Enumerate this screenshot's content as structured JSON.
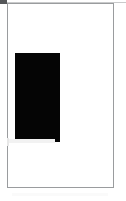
{
  "canvas": {
    "width_px": 126,
    "height_px": 201,
    "background_color": "#ffffff"
  },
  "document_view": {
    "name": "blank-page-with-black-block",
    "page": {
      "left_px": 7,
      "top_px": 3,
      "width_px": 107,
      "height_px": 185,
      "fill_color": "#ffffff",
      "border_color": "#9a9c9e",
      "border_width_px": 1
    },
    "text_content": "",
    "blocks": [
      {
        "id": "black-block",
        "shape": "rectangle",
        "fill_color": "#050505",
        "left_px": 7,
        "top_px": 49,
        "width_px": 45,
        "height_px": 89
      }
    ]
  },
  "chrome": {
    "corner_stub": {
      "color": "#555759",
      "left_px": 0,
      "top_px": 0,
      "width_px": 7,
      "height_px": 4
    },
    "top_rule": {
      "color": "#c9cacb",
      "left_px": 7,
      "top_px": 2,
      "width_px": 119,
      "height_px": 1
    }
  },
  "artifacts": {
    "smudge_under_block_color": "#f2f2f2",
    "left_edge_smudge_color": "#e8e8e8",
    "bottom_haze_color": "#fafafa"
  }
}
